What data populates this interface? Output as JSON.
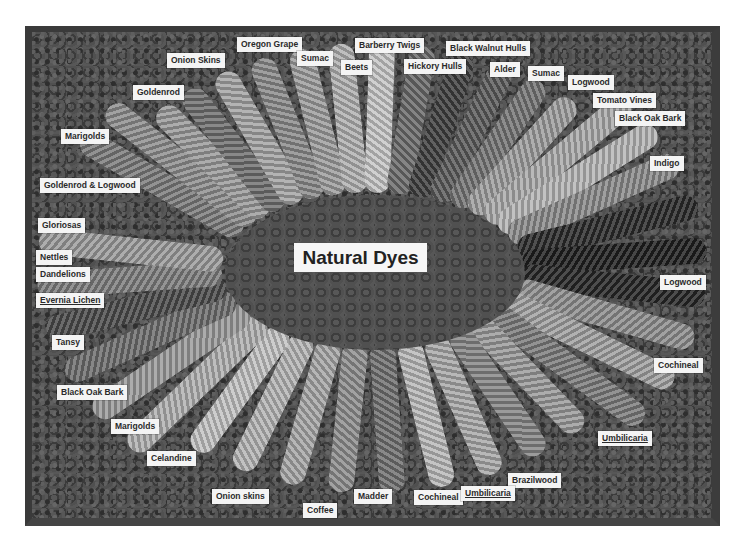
{
  "title": "Natural Dyes",
  "labels": [
    {
      "text": "Oregon Grape",
      "x": 237,
      "y": 37
    },
    {
      "text": "Barberry Twigs",
      "x": 355,
      "y": 38
    },
    {
      "text": "Black Walnut Hulls",
      "x": 446,
      "y": 41
    },
    {
      "text": "Onion Skins",
      "x": 167,
      "y": 53
    },
    {
      "text": "Sumac",
      "x": 297,
      "y": 51
    },
    {
      "text": "Beets",
      "x": 341,
      "y": 60
    },
    {
      "text": "Hickory Hulls",
      "x": 404,
      "y": 59
    },
    {
      "text": "Alder",
      "x": 490,
      "y": 62
    },
    {
      "text": "Sumac",
      "x": 528,
      "y": 66
    },
    {
      "text": "Logwood",
      "x": 568,
      "y": 75
    },
    {
      "text": "Goldenrod",
      "x": 133,
      "y": 85
    },
    {
      "text": "Tomato Vines",
      "x": 593,
      "y": 93
    },
    {
      "text": "Black Oak Bark",
      "x": 615,
      "y": 111
    },
    {
      "text": "Marigolds",
      "x": 61,
      "y": 129
    },
    {
      "text": "Indigo",
      "x": 650,
      "y": 156
    },
    {
      "text": "Goldenrod & Logwood",
      "x": 40,
      "y": 178
    },
    {
      "text": "Gloriosas",
      "x": 38,
      "y": 218
    },
    {
      "text": "Nettles",
      "x": 36,
      "y": 250
    },
    {
      "text": "Dandelions",
      "x": 36,
      "y": 267
    },
    {
      "text": "Evernia Lichen",
      "x": 36,
      "y": 293,
      "underline": true
    },
    {
      "text": "Logwood",
      "x": 660,
      "y": 275
    },
    {
      "text": "Tansy",
      "x": 52,
      "y": 335
    },
    {
      "text": "Cochineal",
      "x": 654,
      "y": 358
    },
    {
      "text": "Black Oak Bark",
      "x": 57,
      "y": 385
    },
    {
      "text": "Marigolds",
      "x": 111,
      "y": 419
    },
    {
      "text": "Umbilicaria",
      "x": 598,
      "y": 431,
      "underline": true
    },
    {
      "text": "Celandine",
      "x": 147,
      "y": 451
    },
    {
      "text": "Brazilwood",
      "x": 508,
      "y": 473
    },
    {
      "text": "Onion skins",
      "x": 212,
      "y": 489
    },
    {
      "text": "Madder",
      "x": 354,
      "y": 489
    },
    {
      "text": "Cochineal",
      "x": 414,
      "y": 490
    },
    {
      "text": "Umbilicaria",
      "x": 461,
      "y": 486,
      "underline": true
    },
    {
      "text": "Coffee",
      "x": 303,
      "y": 503
    }
  ],
  "skeins": [
    {
      "angle": -60,
      "color": "#7a7a7a"
    },
    {
      "angle": -52,
      "color": "#8d8d8d"
    },
    {
      "angle": -45,
      "color": "#9a9a9a"
    },
    {
      "angle": -38,
      "color": "#6f6f6f"
    },
    {
      "angle": -30,
      "color": "#a3a3a3"
    },
    {
      "angle": -22,
      "color": "#8a8a8a"
    },
    {
      "angle": -14,
      "color": "#9c9c9c"
    },
    {
      "angle": -6,
      "color": "#b0b0b0"
    },
    {
      "angle": 2,
      "color": "#c6c6c6"
    },
    {
      "angle": 10,
      "color": "#6a6a6a"
    },
    {
      "angle": 18,
      "color": "#3e3e3e"
    },
    {
      "angle": 26,
      "color": "#5a5a5a"
    },
    {
      "angle": 34,
      "color": "#747474"
    },
    {
      "angle": 42,
      "color": "#9d9d9d"
    },
    {
      "angle": 50,
      "color": "#aaaaaa"
    },
    {
      "angle": 58,
      "color": "#b5b5b5"
    },
    {
      "angle": 66,
      "color": "#8a8a8a"
    },
    {
      "angle": 76,
      "color": "#2a2a2a"
    },
    {
      "angle": 86,
      "color": "#1e1e1e"
    },
    {
      "angle": 96,
      "color": "#262626"
    },
    {
      "angle": 106,
      "color": "#8d8d8d"
    },
    {
      "angle": 116,
      "color": "#a0a0a0"
    },
    {
      "angle": 126,
      "color": "#7b7b7b"
    },
    {
      "angle": 136,
      "color": "#9a9a9a"
    },
    {
      "angle": 146,
      "color": "#858585"
    },
    {
      "angle": 156,
      "color": "#a8a8a8"
    },
    {
      "angle": 166,
      "color": "#b8b8b8"
    },
    {
      "angle": 176,
      "color": "#6f6f6f"
    },
    {
      "angle": 186,
      "color": "#8e8e8e"
    },
    {
      "angle": 196,
      "color": "#a6a6a6"
    },
    {
      "angle": 206,
      "color": "#b4b4b4"
    },
    {
      "angle": 216,
      "color": "#c2c2c2"
    },
    {
      "angle": 226,
      "color": "#b0b0b0"
    },
    {
      "angle": 236,
      "color": "#9a9a9a"
    },
    {
      "angle": 246,
      "color": "#6c6c6c"
    },
    {
      "angle": 256,
      "color": "#4a4a4a"
    },
    {
      "angle": 266,
      "color": "#7d7d7d"
    },
    {
      "angle": 276,
      "color": "#9b9b9b"
    }
  ]
}
